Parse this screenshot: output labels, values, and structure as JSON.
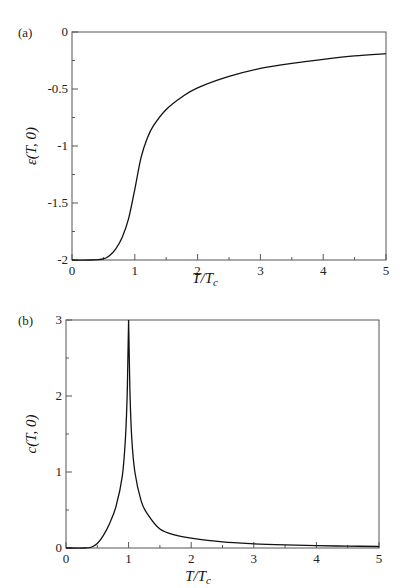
{
  "chart_data": [
    {
      "panel": "(a)",
      "type": "line",
      "title": "",
      "xlabel": "T/T_c",
      "ylabel": "ε(T,0)",
      "xlim": [
        0,
        5
      ],
      "ylim": [
        -2,
        0
      ],
      "xticks": [
        "0",
        "1",
        "2",
        "3",
        "4",
        "5"
      ],
      "yticks": [
        "0",
        "-0.5",
        "-1",
        "-1.5",
        "-2"
      ],
      "grid": false,
      "legend": null,
      "series": [
        {
          "name": "ε(T,0)",
          "x": [
            0,
            0.3,
            0.5,
            0.6,
            0.7,
            0.8,
            0.9,
            1.0,
            1.1,
            1.2,
            1.3,
            1.5,
            1.75,
            2.0,
            2.5,
            3.0,
            3.5,
            4.0,
            4.5,
            5.0
          ],
          "y": [
            -2.0,
            -2.0,
            -1.99,
            -1.96,
            -1.9,
            -1.8,
            -1.64,
            -1.38,
            -1.1,
            -0.93,
            -0.82,
            -0.68,
            -0.57,
            -0.49,
            -0.39,
            -0.32,
            -0.275,
            -0.24,
            -0.21,
            -0.19
          ]
        }
      ]
    },
    {
      "panel": "(b)",
      "type": "line",
      "title": "",
      "xlabel": "T/T_c",
      "ylabel": "c(T,0)",
      "xlim": [
        0,
        5
      ],
      "ylim": [
        0,
        3
      ],
      "xticks": [
        "0",
        "1",
        "2",
        "3",
        "4",
        "5"
      ],
      "yticks": [
        "0",
        "1",
        "2",
        "3"
      ],
      "grid": false,
      "legend": null,
      "series": [
        {
          "name": "c(T,0)",
          "x": [
            0,
            0.3,
            0.4,
            0.5,
            0.6,
            0.7,
            0.8,
            0.9,
            0.95,
            0.98,
            1.0,
            1.02,
            1.05,
            1.1,
            1.2,
            1.3,
            1.5,
            1.75,
            2.0,
            2.5,
            3.0,
            3.5,
            4.0,
            4.5,
            5.0
          ],
          "y": [
            0,
            0.0,
            0.01,
            0.06,
            0.17,
            0.33,
            0.55,
            0.95,
            1.45,
            2.1,
            3.0,
            2.1,
            1.45,
            1.0,
            0.62,
            0.45,
            0.25,
            0.17,
            0.13,
            0.08,
            0.055,
            0.04,
            0.03,
            0.025,
            0.02
          ]
        }
      ]
    }
  ],
  "labels": {
    "panel_a": "(a)",
    "panel_b": "(b)",
    "a_xlabel": "T/T",
    "a_xlabel_sub": "c",
    "a_ylabel": "ε(T, 0)",
    "b_xlabel": "T/T",
    "b_xlabel_sub": "c",
    "b_ylabel": "c(T, 0)"
  },
  "colors": {
    "line": "#111111",
    "axis": "#555555"
  }
}
